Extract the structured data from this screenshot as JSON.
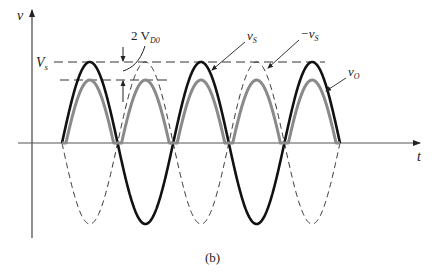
{
  "figure": {
    "caption": "(b)",
    "axes": {
      "y_label": "v",
      "x_label": "t"
    },
    "levels": {
      "vs_label": "V",
      "vs_sub": "s"
    },
    "annotations": {
      "drop_prefix": "2 V",
      "drop_sub": "D0",
      "vs_curve_label": "v",
      "vs_curve_sub": "S",
      "neg_vs_label": "−v",
      "neg_vs_sub": "S",
      "vo_label": "v",
      "vo_sub": "O"
    },
    "curves": [
      {
        "name": "v_S",
        "style": "solid black thick"
      },
      {
        "name": "-v_S",
        "style": "dashed black thin"
      },
      {
        "name": "v_O",
        "style": "solid gray thick"
      }
    ],
    "colors": {
      "vs": "#111111",
      "neg_vs": "#333333",
      "vo": "#8a8a8a",
      "axis": "#444444"
    }
  }
}
